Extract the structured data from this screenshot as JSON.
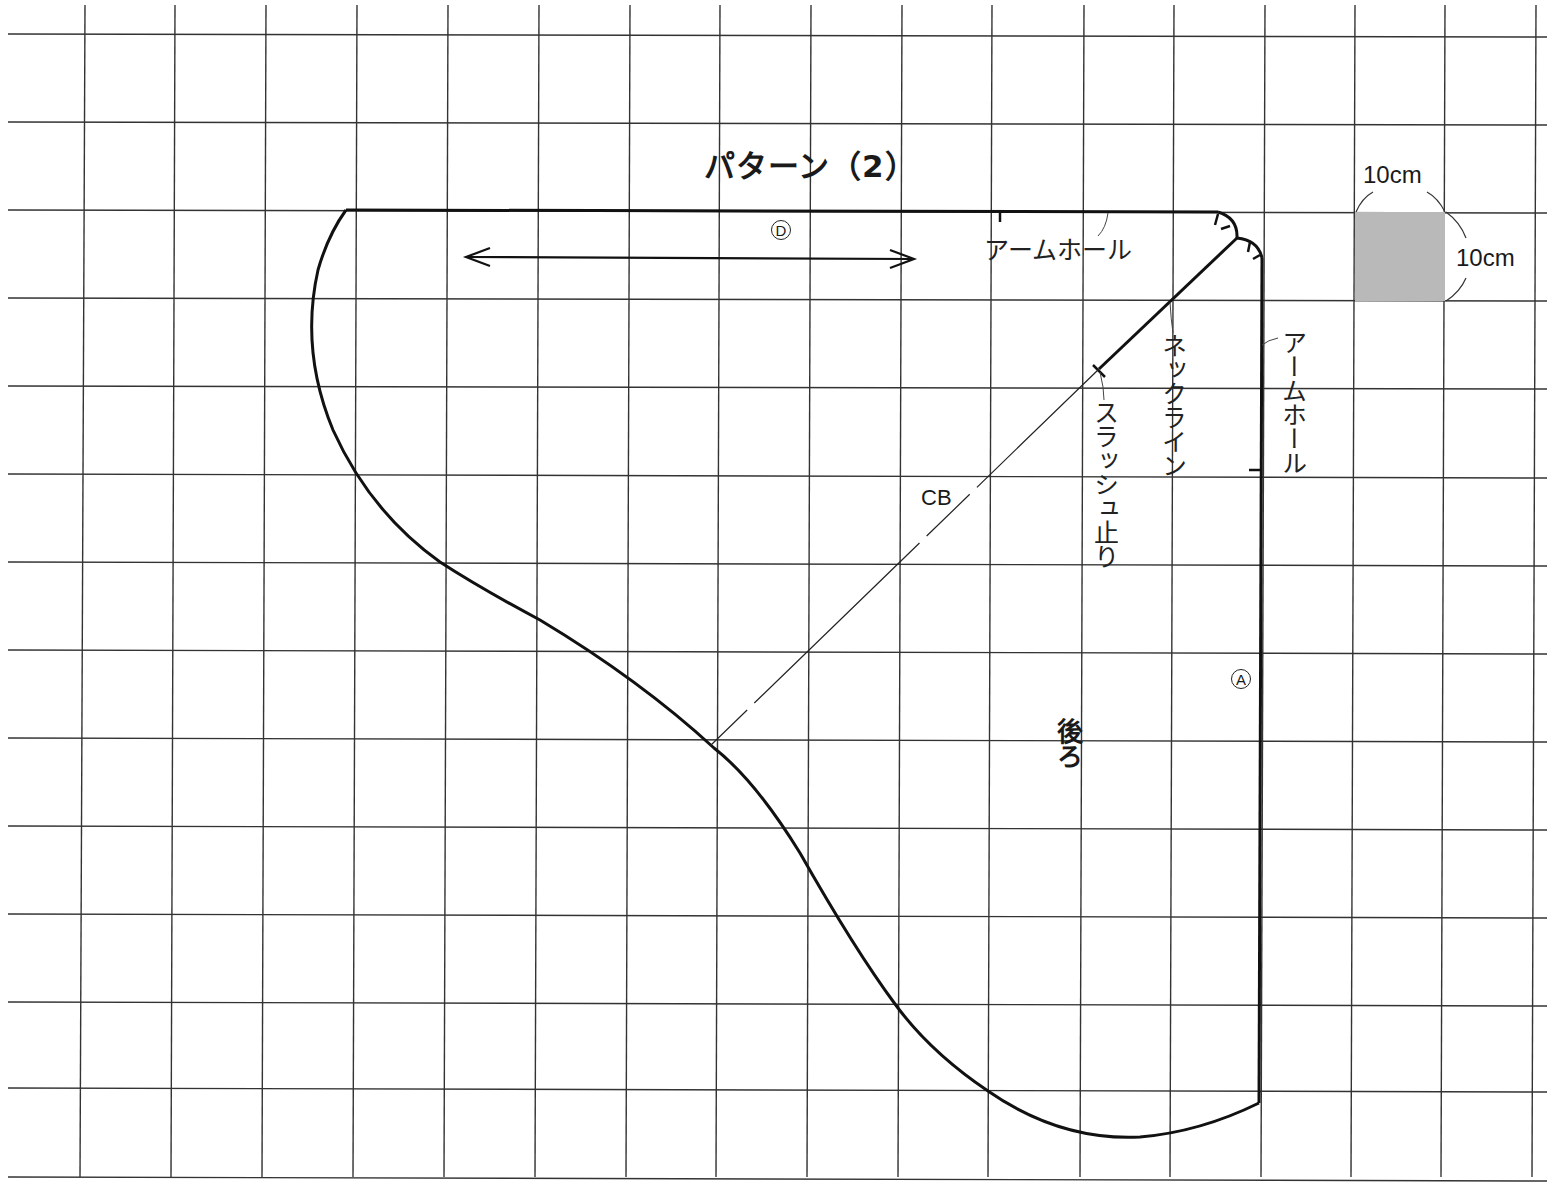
{
  "title": "パターン（2）",
  "scale": {
    "width_label": "10cm",
    "height_label": "10cm",
    "swatch_color": "#b9b9b9"
  },
  "grid": {
    "vertical_x": [
      85,
      175,
      266,
      357,
      448,
      539,
      630,
      720,
      811,
      902,
      992,
      1084,
      1174,
      1265,
      1355,
      1445,
      1536
    ],
    "horizontal_y": [
      34,
      122,
      210,
      298,
      386,
      474,
      562,
      650,
      738,
      826,
      914,
      1002,
      1088,
      1177
    ],
    "cell_size_label": "10cm"
  },
  "pattern_piece": {
    "name": "後ろ",
    "marks": {
      "top_edge": "D",
      "right_edge": "A"
    },
    "labels": {
      "armhole_top": "アームホール",
      "armhole_right": "アームホール",
      "neckline": "ネックライン",
      "slash_stop": "スラッシュ止り",
      "center_back": "CB"
    },
    "grainline": "double-arrow-horizontal"
  }
}
